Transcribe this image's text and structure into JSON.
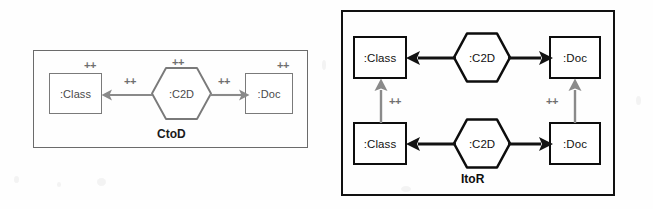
{
  "canvas": {
    "width": 653,
    "height": 209,
    "background": "#fefefe"
  },
  "colors": {
    "gray_stroke": "#7a7a7a",
    "gray_frame": "#6b6b6b",
    "black_stroke": "#0d0d0d",
    "gray_arrow": "#8a8a8a",
    "black_arrow": "#121212",
    "plus_gray": "#6e6e6e",
    "text_dark": "#111111"
  },
  "diagrams": [
    {
      "id": "ctod",
      "caption": "CtoD",
      "style": "gray",
      "nodes": [
        {
          "name": "class-node",
          "label": ":Class",
          "shape": "rectangle"
        },
        {
          "name": "c2d-node",
          "label": ":C2D",
          "shape": "hexagon"
        },
        {
          "name": "doc-node",
          "label": ":Doc",
          "shape": "rectangle"
        }
      ],
      "edges": [
        {
          "name": "c2d-to-class-arrow",
          "from": ":C2D",
          "to": ":Class",
          "direction": "left",
          "marker": "++"
        },
        {
          "name": "c2d-to-doc-arrow",
          "from": ":C2D",
          "to": ":Doc",
          "direction": "right",
          "marker": "++"
        }
      ],
      "markers": [
        {
          "name": "class-created-marker",
          "label": "++",
          "target": ":Class"
        },
        {
          "name": "c2d-created-marker",
          "label": "++",
          "target": ":C2D"
        },
        {
          "name": "doc-created-marker",
          "label": "++",
          "target": ":Doc"
        },
        {
          "name": "left-edge-marker",
          "label": "++",
          "target": "c2d-to-class-arrow"
        },
        {
          "name": "right-edge-marker",
          "label": "++",
          "target": "c2d-to-doc-arrow"
        }
      ]
    },
    {
      "id": "itor",
      "caption": "ItoR",
      "style": "black",
      "nodes": [
        {
          "name": "class-node-top",
          "label": ":Class",
          "shape": "rectangle"
        },
        {
          "name": "c2d-node-top",
          "label": ":C2D",
          "shape": "hexagon"
        },
        {
          "name": "doc-node-top",
          "label": ":Doc",
          "shape": "rectangle"
        },
        {
          "name": "class-node-bottom",
          "label": ":Class",
          "shape": "rectangle"
        },
        {
          "name": "c2d-node-bottom",
          "label": ":C2D",
          "shape": "hexagon"
        },
        {
          "name": "doc-node-bottom",
          "label": ":Doc",
          "shape": "rectangle"
        }
      ],
      "edges": [
        {
          "name": "c2d-top-to-class-top-arrow",
          "from": ":C2D",
          "to": ":Class",
          "direction": "left",
          "marker": ""
        },
        {
          "name": "c2d-top-to-doc-top-arrow",
          "from": ":C2D",
          "to": ":Doc",
          "direction": "right",
          "marker": ""
        },
        {
          "name": "c2d-bottom-to-class-bottom-arrow",
          "from": ":C2D",
          "to": ":Class",
          "direction": "left",
          "marker": ""
        },
        {
          "name": "c2d-bottom-to-doc-bottom-arrow",
          "from": ":C2D",
          "to": ":Doc",
          "direction": "right",
          "marker": ""
        },
        {
          "name": "class-bottom-to-class-top-arrow",
          "from": ":Class",
          "to": ":Class",
          "direction": "up",
          "marker": "++"
        },
        {
          "name": "doc-bottom-to-doc-top-arrow",
          "from": ":Doc",
          "to": ":Doc",
          "direction": "up",
          "marker": "++"
        }
      ],
      "markers": [
        {
          "name": "class-link-marker",
          "label": "++",
          "target": "class-bottom-to-class-top-arrow"
        },
        {
          "name": "doc-link-marker",
          "label": "++",
          "target": "doc-bottom-to-doc-top-arrow"
        }
      ]
    }
  ],
  "labels": {
    "class": ":Class",
    "c2d": ":C2D",
    "doc": ":Doc",
    "plus": "++",
    "ctod": "CtoD",
    "itor": "ItoR"
  }
}
